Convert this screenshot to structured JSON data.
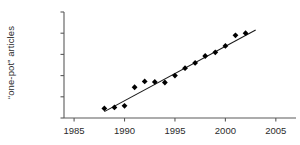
{
  "chart_data": {
    "type": "scatter",
    "title": "",
    "xlabel": "",
    "ylabel": "“one-pot” articles",
    "x": [
      1988,
      1989,
      1990,
      1991,
      1992,
      1993,
      1994,
      1995,
      1996,
      1997,
      1998,
      1999,
      2000,
      2001,
      2002
    ],
    "values": [
      90,
      100,
      115,
      290,
      345,
      340,
      335,
      400,
      470,
      520,
      585,
      620,
      680,
      780,
      800
    ],
    "series": [
      {
        "name": "“one-pot” articles",
        "values": [
          90,
          100,
          115,
          290,
          345,
          340,
          335,
          400,
          470,
          520,
          585,
          620,
          680,
          780,
          800
        ]
      }
    ],
    "trendline": {
      "x": [
        1988,
        2003
      ],
      "y": [
        60,
        830
      ]
    },
    "xlim": [
      1984,
      2007
    ],
    "ylim": [
      0,
      1000
    ],
    "xticks": [
      1985,
      1990,
      1995,
      2000,
      2005
    ],
    "xtick_labels": [
      "1985",
      "1990",
      "1995",
      "2000",
      "2005"
    ],
    "yticks": [
      0,
      200,
      400,
      600,
      800,
      1000
    ],
    "ytick_labels": [
      "0",
      "200",
      "400",
      "600",
      "800",
      "1000"
    ],
    "grid": false,
    "legend": "none",
    "marker": "diamond",
    "marker_color": "#000000",
    "line_color": "#1a1a1a",
    "axis_color": "#5a5a5a"
  }
}
